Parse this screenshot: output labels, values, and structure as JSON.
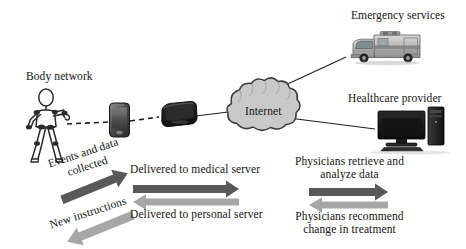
{
  "diagram": {
    "title_text_present": false,
    "background": "#ffffff",
    "labels": {
      "body_network": "Body network",
      "internet": "Internet",
      "emergency_services": "Emergency services",
      "healthcare_provider": "Healthcare provider",
      "events_and_data_collected": "Events and data\ncollected",
      "events_line1": "Events and data",
      "events_line2": "collected",
      "new_instructions": "New instructions",
      "delivered_to_medical_server": "Delivered to medical server",
      "delivered_to_personal_server": "Delivered to personal server",
      "physicians_retrieve_line1": "Physicians retrieve and",
      "physicians_retrieve_line2": "analyze data",
      "physicians_recommend_line1": "Physicians recommend",
      "physicians_recommend_line2": "change in treatment"
    },
    "nodes": [
      {
        "id": "body-network",
        "name": "body-network-stick-figure",
        "label": "Body network"
      },
      {
        "id": "smartphone",
        "name": "smartphone-device",
        "label": ""
      },
      {
        "id": "gateway",
        "name": "gateway-router-device",
        "label": ""
      },
      {
        "id": "internet-cloud",
        "name": "internet-cloud",
        "label": "Internet"
      },
      {
        "id": "ambulance",
        "name": "ambulance-vehicle",
        "label": "Emergency services"
      },
      {
        "id": "desktop",
        "name": "desktop-computer",
        "label": "Healthcare provider"
      }
    ],
    "connections": [
      {
        "id": "figure-to-phone",
        "style": "dashed",
        "color": "#1f1f1f"
      },
      {
        "id": "phone-to-gateway",
        "style": "dashed",
        "color": "#1f1f1f"
      },
      {
        "id": "gateway-to-cloud",
        "style": "solid",
        "color": "#1f1f1f"
      },
      {
        "id": "cloud-to-ambulance",
        "style": "solid",
        "color": "#1f1f1f"
      },
      {
        "id": "cloud-to-desktop",
        "style": "solid",
        "color": "#1f1f1f"
      }
    ],
    "flow_arrows": [
      {
        "id": "events-and-data-collected",
        "direction": "up-right",
        "color": "#595959",
        "label": "Events and data collected"
      },
      {
        "id": "new-instructions",
        "direction": "down-left",
        "color": "#a6a6a6",
        "label": "New instructions"
      },
      {
        "id": "delivered-to-medical-server",
        "direction": "right",
        "color": "#595959",
        "label": "Delivered to medical server"
      },
      {
        "id": "delivered-to-personal-server",
        "direction": "left",
        "color": "#a6a6a6",
        "label": "Delivered to personal server"
      },
      {
        "id": "physicians-retrieve-and-analyze-data",
        "direction": "right",
        "color": "#595959",
        "label": "Physicians retrieve and analyze data"
      },
      {
        "id": "physicians-recommend-change-in-treatment",
        "direction": "left",
        "color": "#a6a6a6",
        "label": "Physicians recommend change in treatment"
      }
    ],
    "colors": {
      "arrow_dark": "#595959",
      "arrow_light": "#a6a6a6",
      "cloud_fill": "#c9c9c9",
      "cloud_stroke": "#3d3d3d",
      "line": "#1f1f1f",
      "text": "#141414",
      "device_dark": "#1b1b1b",
      "device_mid": "#6e6e6e"
    }
  }
}
